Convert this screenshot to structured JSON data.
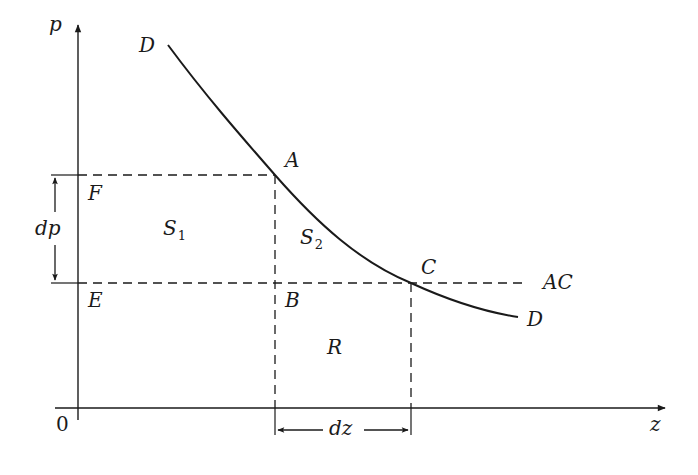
{
  "diagram": {
    "type": "economics-demand-curve",
    "axes": {
      "y_label": "p",
      "x_label": "z",
      "origin_label": "0"
    },
    "curve": {
      "name": "D",
      "start_label": "D",
      "end_label": "D"
    },
    "points": {
      "A": "A",
      "B": "B",
      "C": "C",
      "E": "E",
      "F": "F"
    },
    "regions": {
      "S1": {
        "base": "S",
        "sub": "1"
      },
      "S2": {
        "base": "S",
        "sub": "2"
      },
      "R": "R"
    },
    "lines": {
      "average_cost": "AC"
    },
    "dimensions": {
      "price_change": "dp",
      "quantity_change": "dz"
    },
    "colors": {
      "line": "#1a1a1a",
      "background": "#ffffff"
    }
  }
}
